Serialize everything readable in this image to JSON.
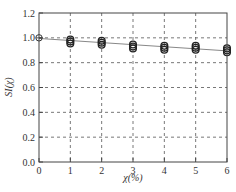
{
  "chart_data": {
    "type": "scatter",
    "title": "",
    "xlabel": "χ(%)",
    "ylabel": "SI(χ)",
    "xlim": [
      0,
      6
    ],
    "ylim": [
      0.0,
      1.2
    ],
    "x_ticks": [
      "0",
      "1",
      "2",
      "3",
      "4",
      "5",
      "6"
    ],
    "y_ticks": [
      "0.0",
      "0.2",
      "0.4",
      "0.6",
      "0.8",
      "1.0",
      "1.2"
    ],
    "grid": true,
    "grid_style": "dashed",
    "legend": null,
    "series": [
      {
        "name": "measured",
        "marker": "open-circle-overlapped",
        "x": [
          0,
          1,
          2,
          3,
          4,
          5,
          6
        ],
        "y": [
          1.0,
          0.97,
          0.96,
          0.93,
          0.92,
          0.92,
          0.9
        ]
      },
      {
        "name": "fit",
        "style": "line",
        "x": [
          0,
          6
        ],
        "y": [
          0.995,
          0.895
        ]
      }
    ]
  },
  "axes": {
    "xlabel_prefix": "χ",
    "xlabel_suffix": "(%)",
    "ylabel_text": "SI(χ)"
  }
}
